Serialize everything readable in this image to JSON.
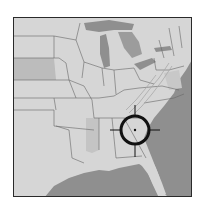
{
  "map": {
    "region": "Eastern United States",
    "style": "grayscale shaded relief",
    "colors": {
      "land": "#d6d6d6",
      "land_dark": "#bcbcbc",
      "land_mid": "#c8c8c8",
      "water": "#8f8f8f",
      "borders": "#555555",
      "frame": "#2a2a2a",
      "marker": "#111111"
    },
    "marker": {
      "type": "crosshair-target",
      "location_description": "Southern Georgia / north Florida",
      "cx": 135,
      "cy": 130,
      "radius": 14
    }
  }
}
